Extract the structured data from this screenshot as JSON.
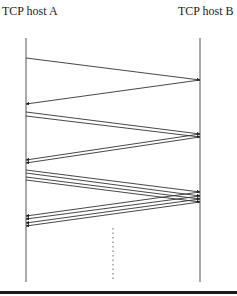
{
  "diagram": {
    "type": "sequence",
    "hosts": [
      {
        "id": "A",
        "label": "TCP host A",
        "x": 26
      },
      {
        "id": "B",
        "label": "TCP host B",
        "x": 200
      }
    ],
    "colors": {
      "line": "#333333",
      "bar": "#1a1a1a",
      "background": "#ffffff"
    },
    "rounds": [
      {
        "segments": 1,
        "send_y": [
          58
        ],
        "arrive_y": [
          80
        ],
        "ack_arrive_y": [
          104
        ]
      },
      {
        "segments": 2,
        "send_y": [
          112,
          116
        ],
        "arrive_y": [
          134,
          137
        ],
        "ack_arrive_y": [
          160,
          163
        ]
      },
      {
        "segments": 4,
        "send_y": [
          170,
          173,
          177,
          180
        ],
        "arrive_y": [
          192,
          196,
          199,
          202
        ],
        "ack_arrive_y": [
          216,
          219,
          223,
          226
        ]
      }
    ],
    "continuation": "dotted-line"
  }
}
